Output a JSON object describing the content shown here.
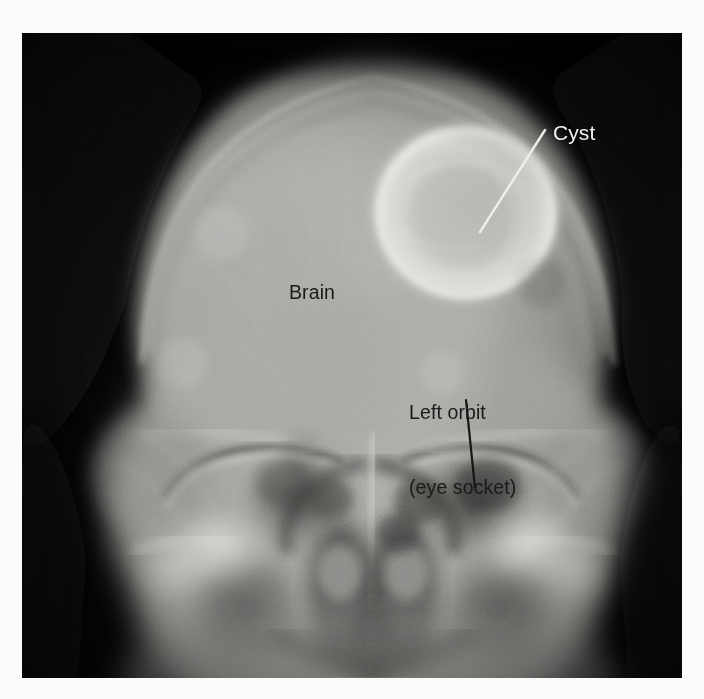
{
  "image": {
    "type": "radiograph",
    "modality": "skull-xray-ap-view",
    "plate": {
      "left": 22,
      "top": 33,
      "width": 660,
      "height": 645,
      "background_color": "#050505",
      "page_background_color": "#fbfbfa"
    }
  },
  "annotations": [
    {
      "id": "cyst",
      "label": "Cyst",
      "text_color": "#f2f2f0",
      "style": "light-on-dark",
      "text_x": 553,
      "text_y": 121,
      "font_size": 21,
      "leader_line": {
        "color": "#eeeeea",
        "from_x": 545,
        "from_y": 130,
        "to_x": 480,
        "to_y": 232,
        "width": 2
      }
    },
    {
      "id": "brain",
      "label": "Brain",
      "text_color": "#1a1a1a",
      "style": "dark-on-light",
      "text_x": 289,
      "text_y": 281,
      "font_size": 19.5,
      "leader_line": null
    },
    {
      "id": "left-orbit",
      "label": "Left orbit\n(eye socket)",
      "label_line_1": "Left orbit",
      "label_line_2": "(eye socket)",
      "text_color": "#1a1a1a",
      "style": "dark-on-light",
      "text_x": 409,
      "text_y": 350,
      "font_size": 19.5,
      "leader_line": {
        "color": "#141414",
        "from_x": 466,
        "from_y": 400,
        "to_x": 475,
        "to_y": 488,
        "width": 2
      }
    }
  ],
  "anatomy": {
    "cranial_vault": {
      "center_x": 373,
      "center_y": 300,
      "radius_x": 240,
      "radius_y": 255,
      "description": "skull vault silhouette, bright soft-tissue rim"
    },
    "cyst_lesion": {
      "center_x": 466,
      "center_y": 212,
      "radius": 88,
      "description": "rounded radiolucent cyst with bright sclerotic rim, right parietal region"
    },
    "left_orbit": {
      "center_x": 448,
      "center_y": 470
    },
    "right_orbit": {
      "center_x": 286,
      "center_y": 470
    },
    "nasal_cavity": {
      "center_x": 367,
      "center_y": 580
    }
  },
  "palette": {
    "film_black": "#050505",
    "bone_bright": "#d8d8d4",
    "brain_gray": "#9a9a98",
    "soft_tissue": "#6a6a68",
    "paper_white": "#fbfbfa",
    "annotation_light": "#f2f2f0",
    "annotation_dark": "#1a1a1a"
  }
}
